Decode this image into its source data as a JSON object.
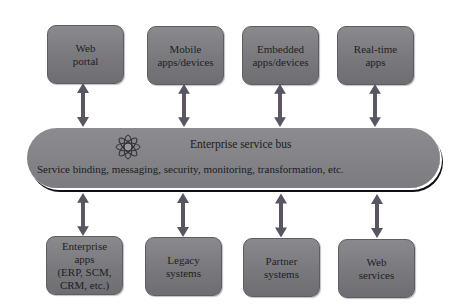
{
  "diagram": {
    "bus": {
      "title": "Enterprise service bus",
      "subtitle": "Service binding, messaging, security, monitoring, transformation, etc.",
      "icon": "atom-flower-icon"
    },
    "top_nodes": [
      {
        "label": "Web\nportal"
      },
      {
        "label": "Mobile\napps/devices"
      },
      {
        "label": "Embedded\napps/devices"
      },
      {
        "label": "Real-time\napps"
      }
    ],
    "bottom_nodes": [
      {
        "label": "Enterprise\napps\n(ERP, SCM,\nCRM, etc.)"
      },
      {
        "label": "Legacy\nsystems"
      },
      {
        "label": "Partner\nsystems"
      },
      {
        "label": "Web\nservices"
      }
    ],
    "connections": "bidirectional",
    "colors": {
      "box_fill": "#7c7c80",
      "bus_fill": "#848488",
      "arrow": "#5a5560",
      "text": "#1e1e22"
    }
  }
}
